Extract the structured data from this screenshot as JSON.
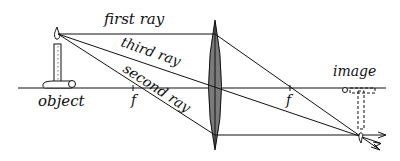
{
  "diagram": {
    "type": "converging-lens-ray-diagram",
    "labels": {
      "first_ray": "first ray",
      "second_ray": "second ray",
      "third_ray": "third ray",
      "object": "object",
      "image": "image",
      "focal_left": "f",
      "focal_right": "f"
    },
    "colors": {
      "ink": "#111111",
      "lens_fill": "#7a7a7a",
      "background": "#ffffff"
    }
  }
}
